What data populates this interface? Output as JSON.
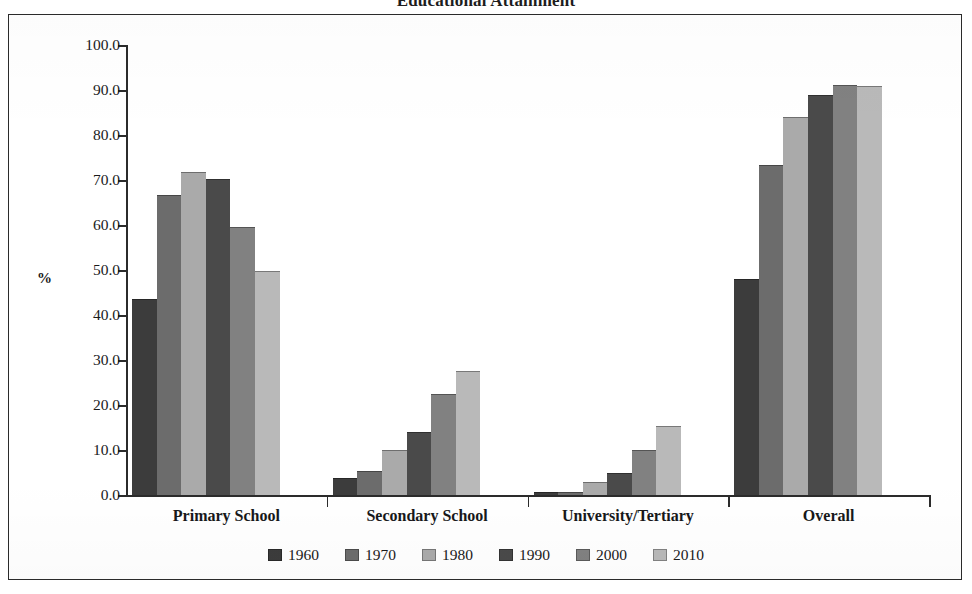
{
  "figure": {
    "title": "Educational Attainment",
    "frame_border_color": "#2b2b2b",
    "background": "#ffffff"
  },
  "chart_data": {
    "type": "bar",
    "title": "Educational Attainment",
    "subtitle": "",
    "xlabel": "",
    "ylabel": "%",
    "ylim": [
      0,
      100
    ],
    "ytick_step": 10,
    "ytick_labels": [
      "100.0",
      "90.0",
      "80.0",
      "70.0",
      "60.0",
      "50.0",
      "40.0",
      "30.0",
      "20.0",
      "10.0",
      "0.0"
    ],
    "ytick_values": [
      100,
      90,
      80,
      70,
      60,
      50,
      40,
      30,
      20,
      10,
      0
    ],
    "grid": false,
    "legend_position": "bottom",
    "categories": [
      "Primary School",
      "Secondary School",
      "University/Tertiary",
      "Overall"
    ],
    "series": [
      {
        "name": "1960",
        "color": "#3c3c3c",
        "values": [
          43.5,
          3.8,
          0.6,
          48.0
        ]
      },
      {
        "name": "1970",
        "color": "#6c6c6c",
        "values": [
          66.7,
          5.3,
          0.7,
          73.3
        ]
      },
      {
        "name": "1980",
        "color": "#aaaaaa",
        "values": [
          71.8,
          9.9,
          2.8,
          84.0
        ]
      },
      {
        "name": "1990",
        "color": "#4a4a4a",
        "values": [
          70.3,
          13.9,
          4.8,
          89.0
        ]
      },
      {
        "name": "2000",
        "color": "#818181",
        "values": [
          59.5,
          22.4,
          9.9,
          91.2
        ]
      },
      {
        "name": "2010",
        "color": "#b9b9b9",
        "values": [
          49.7,
          27.5,
          15.4,
          91.0
        ]
      }
    ]
  }
}
